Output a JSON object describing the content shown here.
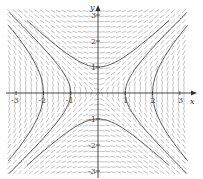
{
  "chart_data": {
    "type": "slope_field",
    "title": "",
    "xlabel": "x",
    "ylabel": "y",
    "xlim": [
      -3.3,
      3.5
    ],
    "ylim": [
      -3.1,
      3.4
    ],
    "x_ticks": [
      -3,
      -2,
      -1,
      1,
      2,
      3
    ],
    "x_tick_labels": [
      "-3",
      "-2",
      "-1",
      "1",
      "2",
      "3"
    ],
    "y_ticks": [
      -3,
      -2,
      -1,
      1,
      2,
      3
    ],
    "y_tick_labels": [
      "-3",
      "-2",
      "-1",
      "1",
      "2",
      "3"
    ],
    "grid": false,
    "field": "dy/dx = x/y",
    "solution_curves": [
      {
        "name": "upper branch",
        "equation": "y^2 - x^2 = 1",
        "vertex": [
          0,
          1
        ]
      },
      {
        "name": "lower branch",
        "equation": "y^2 - x^2 = 1",
        "vertex": [
          0,
          -1
        ]
      },
      {
        "name": "inner left/right",
        "equation": "x^2 - y^2 = 1",
        "x_intercepts": [
          -1,
          1
        ]
      },
      {
        "name": "outer left/right",
        "equation": "x^2 - y^2 = 4",
        "x_intercepts": [
          -2,
          2
        ]
      }
    ],
    "colors": {
      "field": "#9a9a9a",
      "curves": "#555555",
      "axes": "#333333"
    }
  }
}
